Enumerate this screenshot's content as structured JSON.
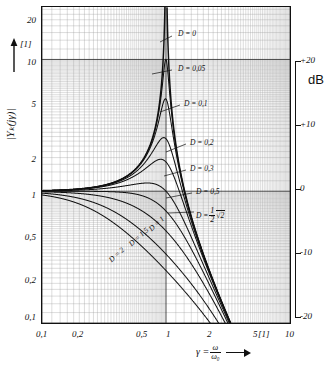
{
  "figure": {
    "caption": "Magnitude frequency response of a second-order lag element for various damping ratios D"
  },
  "axes": {
    "y_label": "|Yₖ(jγ)|",
    "y_unit": "[1]",
    "x_unit": "[1]",
    "x_label_lhs": "γ =",
    "x_label_num": "ω",
    "x_label_den": "ω₀",
    "db_label": "dB"
  },
  "chart_data": {
    "type": "line",
    "title": "",
    "xlabel": "γ = ω/ω₀",
    "ylabel": "|Yₖ(jγ)|",
    "xscale": "log",
    "yscale": "log",
    "xlim": [
      0.1,
      10
    ],
    "ylim": [
      0.1,
      25
    ],
    "grid": true,
    "legend": "inline-curve-labels",
    "xticks": [
      "0,1",
      "0,2",
      "0,5",
      "1",
      "2",
      "5",
      "10"
    ],
    "xtick_values": [
      0.1,
      0.2,
      0.5,
      1,
      2,
      5,
      10
    ],
    "yticks": [
      "0,1",
      "0,2",
      "0,5",
      "1",
      "2",
      "5",
      "10",
      "20"
    ],
    "ytick_values": [
      0.1,
      0.2,
      0.5,
      1,
      2,
      5,
      10,
      20
    ],
    "secondary_y_axis": {
      "label": "dB",
      "ticks": [
        "+20",
        "+10",
        "0",
        "-10",
        "-20"
      ],
      "tick_values": [
        20,
        10,
        0,
        -10,
        -20
      ]
    },
    "series": [
      {
        "name": "D = 0",
        "D": 0.0,
        "label": "D = 0",
        "peak": 1000.0
      },
      {
        "name": "D = 0,05",
        "D": 0.05,
        "label": "D = 0,05",
        "peak": 10.0
      },
      {
        "name": "D = 0,1",
        "D": 0.1,
        "label": "D = 0,1",
        "peak": 5.03
      },
      {
        "name": "D = 0,2",
        "D": 0.2,
        "label": "D = 0,2",
        "peak": 2.55
      },
      {
        "name": "D = 0,3",
        "D": 0.3,
        "label": "D = 0,3",
        "peak": 1.75
      },
      {
        "name": "D = 0,5",
        "D": 0.5,
        "label": "D = 0,5",
        "peak": 1.155
      },
      {
        "name": "D = 1/2 √2",
        "D": 0.7071,
        "label": "D = ½√2",
        "peak": 1.0
      },
      {
        "name": "D = 1",
        "D": 1.0,
        "label": "D = 1",
        "peak": 1.0
      },
      {
        "name": "D = 1,5",
        "D": 1.5,
        "label": "D = 1,5",
        "peak": 1.0
      },
      {
        "name": "D = 2",
        "D": 2.0,
        "label": "D = 2",
        "peak": 1.0
      }
    ],
    "formula": "|Yk(jγ)| = 1 / sqrt((1-γ^2)^2 + (2 D γ)^2)"
  },
  "curve_labels": [
    {
      "text": "D = 0",
      "x": 178,
      "y": 30
    },
    {
      "text": "D = 0,05",
      "x": 178,
      "y": 65
    },
    {
      "text": "D = 0,1",
      "x": 184,
      "y": 100
    },
    {
      "text": "D = 0,2",
      "x": 190,
      "y": 139
    },
    {
      "text": "D = 0,3",
      "x": 190,
      "y": 165
    },
    {
      "text": "D = 0,5",
      "x": 196,
      "y": 188
    },
    {
      "text": "D = 1",
      "x": 150,
      "y": 226
    },
    {
      "text": "D = 1,5",
      "x": 130,
      "y": 241
    },
    {
      "text": "D = 2",
      "x": 110,
      "y": 257
    }
  ],
  "sqrt_label": {
    "prefix": "D =",
    "frac_num": "1",
    "frac_den": "2",
    "radicand": "2"
  },
  "y_ticks_px": [
    {
      "text": "20",
      "y": 21
    },
    {
      "text": "10",
      "y": 63
    },
    {
      "text": "5",
      "y": 105
    },
    {
      "text": "2",
      "y": 160
    },
    {
      "text": "1",
      "y": 196
    },
    {
      "text": "0,5",
      "y": 238
    },
    {
      "text": "0,2",
      "y": 281
    },
    {
      "text": "0,1",
      "y": 318
    }
  ],
  "x_ticks_px": [
    {
      "text": "0,1",
      "x": 36
    },
    {
      "text": "0,2",
      "x": 72
    },
    {
      "text": "0,5",
      "x": 136
    },
    {
      "text": "1",
      "x": 166
    },
    {
      "text": "2",
      "x": 207
    },
    {
      "text": "5",
      "x": 253
    },
    {
      "text": "10",
      "x": 285
    }
  ],
  "db_ticks_px": [
    {
      "text": "+20",
      "y": 61
    },
    {
      "text": "+10",
      "y": 125
    },
    {
      "text": "0",
      "y": 189
    },
    {
      "text": "-10",
      "y": 253
    },
    {
      "text": "-20",
      "y": 317
    }
  ]
}
